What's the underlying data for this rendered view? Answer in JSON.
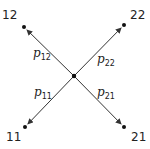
{
  "diagram": {
    "center": {
      "x": 74,
      "y": 76
    },
    "nodes": [
      {
        "id": "12",
        "label": "12",
        "x": 24,
        "y": 27,
        "label_x": 2,
        "label_y": 19
      },
      {
        "id": "22",
        "label": "22",
        "x": 124,
        "y": 25,
        "label_x": 130,
        "label_y": 19
      },
      {
        "id": "11",
        "label": "11",
        "x": 25,
        "y": 127,
        "label_x": 6,
        "label_y": 141
      },
      {
        "id": "21",
        "label": "21",
        "x": 124,
        "y": 127,
        "label_x": 131,
        "label_y": 141
      }
    ],
    "edges": [
      {
        "to": "12",
        "label": "p",
        "sub": "12",
        "label_x": 33,
        "label_y": 57
      },
      {
        "to": "22",
        "label": "p",
        "sub": "22",
        "label_x": 97,
        "label_y": 63
      },
      {
        "to": "11",
        "label": "p",
        "sub": "11",
        "label_x": 34,
        "label_y": 96
      },
      {
        "to": "21",
        "label": "p",
        "sub": "21",
        "label_x": 97,
        "label_y": 96
      }
    ],
    "colors": {
      "line": "#333333",
      "dot": "#111111"
    }
  }
}
